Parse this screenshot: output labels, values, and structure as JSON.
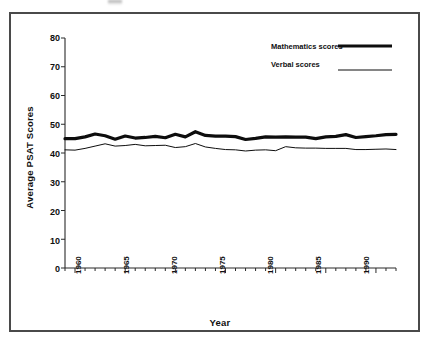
{
  "figure": {
    "background_color": "#ffffff",
    "frame_color": "#4a4a4a",
    "ink_color": "#101010"
  },
  "legend": {
    "position": "top-right",
    "entries": [
      {
        "label": "Mathematics scores",
        "style": "thick-solid-line",
        "line_width": 3.2
      },
      {
        "label": "Verbal scores",
        "style": "thin-solid-line",
        "line_width": 1.0
      }
    ]
  },
  "axes": {
    "y": {
      "title": "Average PSAT Scores",
      "ticks": [
        "80",
        "70",
        "60",
        "50",
        "40",
        "30",
        "20",
        "10",
        "0"
      ],
      "min": 0,
      "max": 80,
      "step": 10
    },
    "x": {
      "title": "Year",
      "ticks": [
        "1960",
        "1965",
        "1970",
        "1975",
        "1980",
        "1985",
        "1990"
      ],
      "min": 1959,
      "max": 1992,
      "label_rotation": "-90"
    }
  },
  "chart_data": {
    "type": "line",
    "title": "",
    "subtitle": "",
    "xlabel": "Year",
    "ylabel": "Average PSAT Scores",
    "xlim": [
      1959,
      1992
    ],
    "ylim": [
      0,
      80
    ],
    "ytick_step": 10,
    "grid": false,
    "legend_position": "top-right",
    "x": [
      1959,
      1960,
      1961,
      1962,
      1963,
      1964,
      1965,
      1966,
      1967,
      1968,
      1969,
      1970,
      1971,
      1972,
      1973,
      1974,
      1975,
      1976,
      1977,
      1978,
      1979,
      1980,
      1981,
      1982,
      1983,
      1984,
      1985,
      1986,
      1987,
      1988,
      1989,
      1990,
      1991,
      1992
    ],
    "series": [
      {
        "name": "Mathematics scores",
        "line_width": 3.2,
        "values": [
          45.0,
          45.0,
          45.6,
          46.6,
          46.0,
          44.8,
          45.9,
          45.2,
          45.4,
          45.8,
          45.3,
          46.5,
          45.6,
          47.4,
          46.1,
          45.9,
          45.9,
          45.7,
          44.7,
          45.1,
          45.6,
          45.5,
          45.6,
          45.5,
          45.5,
          45.0,
          45.6,
          45.8,
          46.4,
          45.4,
          45.7,
          46.0,
          46.4,
          46.5
        ]
      },
      {
        "name": "Verbal scores",
        "line_width": 1.0,
        "values": [
          41.1,
          41.0,
          41.6,
          42.4,
          43.2,
          42.4,
          42.6,
          43.0,
          42.5,
          42.6,
          42.7,
          41.9,
          42.2,
          43.3,
          42.1,
          41.6,
          41.2,
          41.1,
          40.7,
          41.0,
          41.1,
          40.8,
          42.2,
          41.8,
          41.7,
          41.7,
          41.6,
          41.6,
          41.6,
          41.2,
          41.2,
          41.3,
          41.4,
          41.2
        ]
      }
    ]
  }
}
